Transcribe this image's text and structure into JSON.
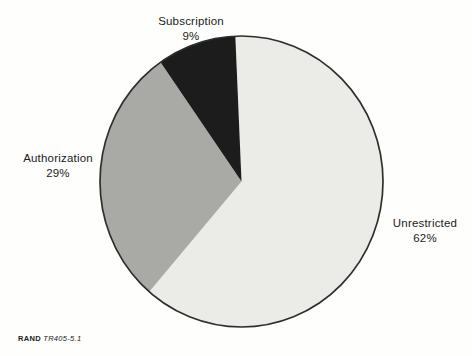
{
  "figure": {
    "source_label": {
      "brand": "RAND",
      "figure_id": "TR405-5.1"
    }
  },
  "chart_data": {
    "type": "pie",
    "categories": [
      "Unrestricted",
      "Authorization",
      "Subscription"
    ],
    "values": [
      62,
      29,
      9
    ],
    "unit": "percent",
    "slice_labels": [
      {
        "name": "Unrestricted",
        "pct": "62%"
      },
      {
        "name": "Authorization",
        "pct": "29%"
      },
      {
        "name": "Subscription",
        "pct": "9%"
      }
    ],
    "slice_colors": [
      "#ebebe8",
      "#a9a9a6",
      "#1c1c1c"
    ],
    "outline_color": "#2e2e2e",
    "start_angle_deg": -2.5,
    "direction": "clockwise",
    "legend": "none",
    "annotations": "labels placed outside slices"
  }
}
